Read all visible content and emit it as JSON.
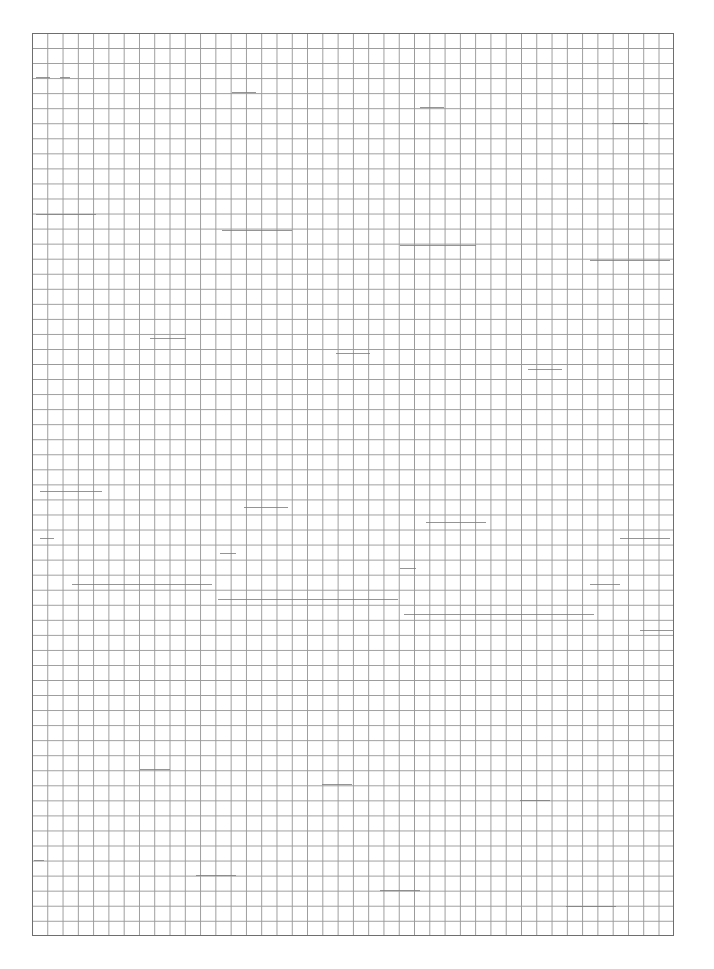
{
  "page": {
    "type": "graph-paper",
    "background_color": "#ffffff",
    "grid": {
      "line_color": "#9a9a9a",
      "border_color": "#6e6e6e",
      "columns": 42,
      "rows": 60,
      "left": 32,
      "top": 33,
      "width": 642,
      "height": 903
    }
  }
}
